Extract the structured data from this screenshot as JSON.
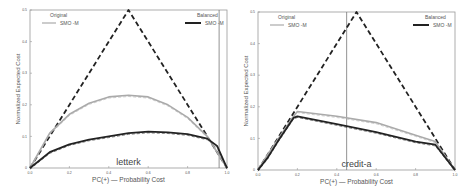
{
  "chart_data": [
    {
      "type": "line",
      "title": "letterk",
      "xlabel": "PC(+) — Probability Cost",
      "ylabel": "Normalized Expected Cost",
      "xlim": [
        0,
        1
      ],
      "ylim": [
        0,
        0.5
      ],
      "xticks": [
        "0.0",
        "0.2",
        "0.4",
        "0.6",
        "0.8",
        "1.0"
      ],
      "yticks": [
        "0",
        "0.1",
        "0.2",
        "0.3",
        "0.4",
        "0.5"
      ],
      "grid": false,
      "legend": [
        {
          "group": "Original",
          "label": "SMO -M",
          "color": "#aaaaaa",
          "position": "top-left"
        },
        {
          "group": "Balanced",
          "label": "SMO -M",
          "color": "#222222",
          "position": "top-right"
        }
      ],
      "vline_x": 0.96,
      "series": [
        {
          "name": "Trivial classifiers (dashed)",
          "style": "dashed",
          "color": "#222222",
          "x": [
            0,
            0.5,
            1
          ],
          "y": [
            0,
            0.5,
            0
          ]
        },
        {
          "name": "Original SMO -M",
          "color": "#aaaaaa",
          "x": [
            0,
            0.1,
            0.2,
            0.3,
            0.4,
            0.5,
            0.6,
            0.7,
            0.8,
            0.9,
            1.0
          ],
          "y": [
            0,
            0.11,
            0.17,
            0.205,
            0.225,
            0.23,
            0.225,
            0.2,
            0.16,
            0.1,
            0
          ]
        },
        {
          "name": "Balanced SMO -M",
          "color": "#222222",
          "x": [
            0,
            0.1,
            0.2,
            0.3,
            0.4,
            0.5,
            0.6,
            0.7,
            0.8,
            0.9,
            0.95,
            1.0
          ],
          "y": [
            0,
            0.05,
            0.075,
            0.09,
            0.1,
            0.11,
            0.115,
            0.113,
            0.107,
            0.093,
            0.07,
            0
          ]
        }
      ]
    },
    {
      "type": "line",
      "title": "credit-a",
      "xlabel": "PC(+) — Probability Cost",
      "ylabel": "Normalized Expected Cost",
      "xlim": [
        0,
        1
      ],
      "ylim": [
        0,
        0.5
      ],
      "xticks": [
        "0.0",
        "0.2",
        "0.4",
        "0.6",
        "0.8",
        "1.0"
      ],
      "yticks": [
        "0",
        "0.1",
        "0.2",
        "0.3",
        "0.4",
        "0.5"
      ],
      "grid": false,
      "legend": [
        {
          "group": "Original",
          "label": "SMO -M",
          "color": "#aaaaaa",
          "position": "top-left"
        },
        {
          "group": "Balanced",
          "label": "SMO -M",
          "color": "#222222",
          "position": "top-right"
        }
      ],
      "vline_x": 0.45,
      "series": [
        {
          "name": "Trivial classifiers (dashed)",
          "style": "dashed",
          "color": "#222222",
          "x": [
            0,
            0.5,
            1
          ],
          "y": [
            0,
            0.5,
            0
          ]
        },
        {
          "name": "Original SMO -M",
          "color": "#aaaaaa",
          "x": [
            0,
            0.05,
            0.18,
            0.2,
            0.4,
            0.6,
            0.8,
            0.9,
            1.0
          ],
          "y": [
            0,
            0.05,
            0.17,
            0.185,
            0.17,
            0.15,
            0.11,
            0.09,
            0
          ]
        },
        {
          "name": "Balanced SMO -M",
          "color": "#222222",
          "x": [
            0,
            0.05,
            0.1,
            0.18,
            0.2,
            0.4,
            0.6,
            0.8,
            0.9,
            1.0
          ],
          "y": [
            0,
            0.04,
            0.09,
            0.165,
            0.17,
            0.145,
            0.12,
            0.09,
            0.08,
            0
          ]
        }
      ]
    }
  ]
}
